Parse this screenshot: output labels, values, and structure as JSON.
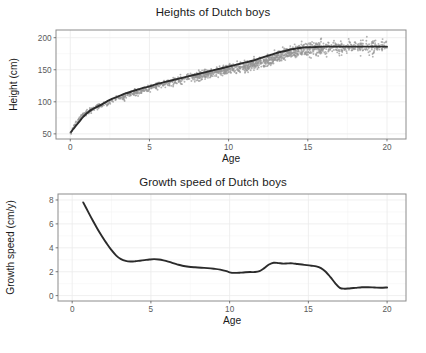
{
  "figure": {
    "width": 426,
    "height": 353,
    "background": "#ffffff",
    "point_color": "#969696",
    "line_color": "#2b2b2b",
    "grid_color": "#ebebeb",
    "border_color": "#8c8c8c"
  },
  "panels": {
    "heights": {
      "title": "Heights of Dutch boys",
      "xlabel": "Age",
      "ylabel": "Height (cm)",
      "xticks": [
        "0",
        "5",
        "10",
        "15",
        "20"
      ],
      "yticks": [
        "50",
        "100",
        "150",
        "200"
      ]
    },
    "growth": {
      "title": "Growth speed of Dutch boys",
      "xlabel": "Age",
      "ylabel": "Growth speed (cm/y)",
      "xticks": [
        "0",
        "5",
        "10",
        "15",
        "20"
      ],
      "yticks": [
        "0",
        "2",
        "4",
        "6",
        "8"
      ]
    }
  },
  "chart_data": [
    {
      "type": "scatter",
      "title": "Heights of Dutch boys",
      "xlabel": "Age",
      "ylabel": "Height (cm)",
      "xlim": [
        -0.9,
        21.2
      ],
      "ylim": [
        42,
        212
      ],
      "xticks": [
        0,
        5,
        10,
        15,
        20
      ],
      "yticks": [
        50,
        100,
        150,
        200
      ],
      "grid": true,
      "legend": "none",
      "point_color": "#969696",
      "series": [
        {
          "name": "Observed heights",
          "note": "Scatter of individual Dutch boys: age (years) vs height (cm); dense cloud rising from ~52 cm at birth to ~185 cm at age 20, widening in spread after age 10.",
          "x": [
            0.05,
            0.08,
            0.12,
            0.15,
            0.18,
            0.22,
            0.25,
            0.3,
            0.35,
            0.4,
            0.45,
            0.5,
            0.55,
            0.6,
            0.65,
            0.7,
            0.8,
            0.9,
            1.0,
            1.1,
            1.2,
            1.3,
            1.4,
            1.5,
            1.6,
            1.7,
            1.8,
            1.9,
            2.0,
            2.2,
            2.4,
            2.6,
            2.8,
            3.0,
            3.2,
            3.4,
            3.6,
            3.8,
            4.0,
            4.2,
            4.4,
            4.6,
            4.8,
            5.0,
            5.2,
            5.4,
            5.6,
            5.8,
            6.0,
            6.3,
            6.6,
            6.9,
            7.2,
            7.5,
            7.8,
            8.1,
            8.4,
            8.7,
            9.0,
            9.3,
            9.6,
            9.9,
            10.2,
            10.5,
            10.8,
            11.1,
            11.4,
            11.7,
            12.0,
            12.3,
            12.6,
            12.9,
            13.2,
            13.5,
            13.8,
            14.1,
            14.4,
            14.7,
            15.0,
            15.3,
            15.6,
            15.9,
            16.2,
            16.5,
            16.8,
            17.1,
            17.4,
            17.7,
            18.0,
            18.4,
            18.8,
            19.2,
            19.6,
            20.0
          ],
          "y": [
            52,
            54,
            56,
            57,
            59,
            61,
            63,
            65,
            67,
            69,
            70,
            72,
            73,
            75,
            76,
            77,
            79,
            81,
            83,
            84,
            86,
            87,
            88,
            90,
            91,
            92,
            93,
            94,
            95,
            97,
            99,
            101,
            103,
            105,
            107,
            108,
            110,
            112,
            113,
            115,
            117,
            118,
            120,
            121,
            123,
            124,
            126,
            127,
            128,
            130,
            132,
            134,
            136,
            138,
            140,
            141,
            143,
            144,
            146,
            147,
            148,
            150,
            151,
            152,
            154,
            155,
            157,
            159,
            161,
            163,
            166,
            169,
            171,
            174,
            176,
            178,
            180,
            181,
            182,
            183,
            184,
            184,
            185,
            185,
            185,
            185,
            185,
            185,
            186,
            186,
            186,
            186,
            186,
            186
          ]
        },
        {
          "name": "Fitted smooth curve",
          "color": "#2b2b2b",
          "note": "Monotone smoothing spline through the height scatter; steep in infancy, near-linear from age 4 to 14, flattening after 16.",
          "x": [
            0.05,
            0.2,
            0.4,
            0.6,
            0.8,
            1.0,
            1.3,
            1.6,
            2.0,
            2.5,
            3.0,
            3.5,
            4.0,
            4.5,
            5.0,
            5.5,
            6.0,
            6.5,
            7.0,
            7.5,
            8.0,
            8.5,
            9.0,
            9.5,
            10.0,
            10.5,
            11.0,
            11.5,
            12.0,
            12.5,
            13.0,
            13.5,
            14.0,
            14.5,
            15.0,
            15.5,
            16.0,
            16.5,
            17.0,
            17.5,
            18.0,
            18.5,
            19.0,
            19.5,
            20.0
          ],
          "y": [
            53,
            58,
            64,
            70,
            76,
            81,
            87,
            91,
            96,
            103,
            108,
            113,
            117,
            121,
            124,
            128,
            131,
            134,
            137,
            140,
            143,
            146,
            149,
            152,
            155,
            158,
            161,
            164,
            168,
            172,
            176,
            179,
            182,
            184,
            185,
            185.5,
            186,
            186,
            186,
            186,
            186,
            186,
            186,
            186,
            186
          ]
        }
      ]
    },
    {
      "type": "line",
      "title": "Growth speed of Dutch boys",
      "xlabel": "Age",
      "ylabel": "Growth speed (cm/y)",
      "xlim": [
        -0.9,
        21.2
      ],
      "ylim": [
        -0.45,
        8.5
      ],
      "xticks": [
        0,
        5,
        10,
        15,
        20
      ],
      "yticks": [
        0,
        2,
        4,
        6,
        8
      ],
      "grid": true,
      "legend": "none",
      "series": [
        {
          "name": "Growth velocity",
          "color": "#2b2b2b",
          "note": "Derivative of the fitted height curve: very high in infancy (~7.8 cm/y at 0.7 y), falling to ~2.85 by age 3.5, small mid-childhood bump peaking ~3.05 at age 5.2, trough ~1.9 at age 10, pubertal spurt peaking ~2.75 between 12.8 and 14, then sharp decline to ~0.6 by age 17 and flat ~0.65 to age 20.",
          "x": [
            0.7,
            1.0,
            1.3,
            1.6,
            1.9,
            2.2,
            2.5,
            2.8,
            3.1,
            3.4,
            3.7,
            4.0,
            4.3,
            4.6,
            4.9,
            5.2,
            5.5,
            5.8,
            6.1,
            6.4,
            6.7,
            7.0,
            7.4,
            7.8,
            8.2,
            8.6,
            9.0,
            9.4,
            9.8,
            10.0,
            10.3,
            10.7,
            11.0,
            11.3,
            11.6,
            11.9,
            12.2,
            12.5,
            12.8,
            13.1,
            13.4,
            13.7,
            14.0,
            14.3,
            14.6,
            14.9,
            15.2,
            15.5,
            15.8,
            16.1,
            16.4,
            16.7,
            17.0,
            17.3,
            17.6,
            18.0,
            18.4,
            18.8,
            19.2,
            19.6,
            20.0
          ],
          "y": [
            7.8,
            7.05,
            6.3,
            5.6,
            4.95,
            4.35,
            3.8,
            3.35,
            3.05,
            2.9,
            2.85,
            2.87,
            2.92,
            2.97,
            3.02,
            3.05,
            3.02,
            2.95,
            2.85,
            2.72,
            2.6,
            2.5,
            2.42,
            2.37,
            2.33,
            2.3,
            2.25,
            2.18,
            2.05,
            1.95,
            1.9,
            1.92,
            1.95,
            1.97,
            1.97,
            2.05,
            2.3,
            2.6,
            2.75,
            2.72,
            2.68,
            2.7,
            2.7,
            2.65,
            2.6,
            2.55,
            2.5,
            2.45,
            2.3,
            2.0,
            1.55,
            1.05,
            0.65,
            0.58,
            0.6,
            0.65,
            0.7,
            0.7,
            0.68,
            0.66,
            0.68
          ]
        }
      ]
    }
  ]
}
